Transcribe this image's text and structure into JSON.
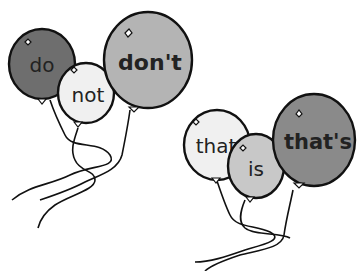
{
  "groups": [
    {
      "name": "do-not-group",
      "balloons": [
        {
          "word": "do",
          "color": "#6e6e6e",
          "bold": false
        },
        {
          "word": "not",
          "color": "#f0f0f0",
          "bold": false
        },
        {
          "word": "don't",
          "color": "#b4b4b4",
          "bold": true
        }
      ]
    },
    {
      "name": "that-is-group",
      "balloons": [
        {
          "word": "that",
          "color": "#f0f0f0",
          "bold": false
        },
        {
          "word": "is",
          "color": "#c8c8c8",
          "bold": false
        },
        {
          "word": "that's",
          "color": "#8a8a8a",
          "bold": true
        }
      ]
    }
  ]
}
